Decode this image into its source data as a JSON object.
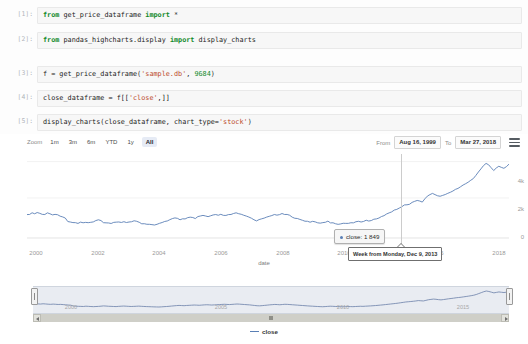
{
  "notebook": {
    "cells": [
      {
        "prompt": "[1]:",
        "segments": [
          {
            "t": "from ",
            "c": "kw"
          },
          {
            "t": "get_price_dataframe ",
            "c": "op"
          },
          {
            "t": "import ",
            "c": "kw"
          },
          {
            "t": "*",
            "c": "op"
          }
        ],
        "plain": "from get_price_dataframe import *"
      },
      {
        "prompt": "[2]:",
        "segments": [
          {
            "t": "from ",
            "c": "kw"
          },
          {
            "t": "pandas_highcharts.display ",
            "c": "op"
          },
          {
            "t": "import ",
            "c": "kw"
          },
          {
            "t": "display_charts",
            "c": "op"
          }
        ],
        "plain": "from pandas_highcharts.display import display_charts"
      },
      {
        "prompt": "[3]:",
        "segments": [
          {
            "t": "f = get_price_dataframe(",
            "c": "op"
          },
          {
            "t": "'sample.db'",
            "c": "str"
          },
          {
            "t": ", ",
            "c": "op"
          },
          {
            "t": "9684",
            "c": "num"
          },
          {
            "t": ")",
            "c": "op"
          }
        ],
        "plain": "f = get_price_dataframe('sample.db', 9684)"
      },
      {
        "prompt": "[4]:",
        "segments": [
          {
            "t": "close_dataframe = f[[",
            "c": "op"
          },
          {
            "t": "'close'",
            "c": "str"
          },
          {
            "t": ",]]",
            "c": "op"
          }
        ],
        "plain": "close_dataframe = f[['close',]]"
      },
      {
        "prompt": "[5]:",
        "segments": [
          {
            "t": "display_charts(close_dataframe, chart_type=",
            "c": "op"
          },
          {
            "t": "'stock'",
            "c": "str"
          },
          {
            "t": ")",
            "c": "op"
          }
        ],
        "plain": "display_charts(close_dataframe, chart_type='stock')"
      }
    ]
  },
  "chart_toolbar": {
    "zoom_label": "Zoom",
    "range_buttons": [
      {
        "label": "1m",
        "selected": false
      },
      {
        "label": "3m",
        "selected": false
      },
      {
        "label": "6m",
        "selected": false
      },
      {
        "label": "YTD",
        "selected": false
      },
      {
        "label": "1y",
        "selected": false
      },
      {
        "label": "All",
        "selected": true
      }
    ],
    "from_label": "From",
    "from_value": "Aug 16, 1999",
    "to_label": "To",
    "to_value": "Mar 27, 2018",
    "menu_icon": "hamburger-menu-icon"
  },
  "tooltip": {
    "series_name": "close",
    "value": "1 849",
    "text": "close: 1 849",
    "x_label": "Week from Monday, Dec 9, 2013"
  },
  "legend": {
    "items": [
      {
        "name": "close",
        "color": "#5a7fb5"
      }
    ]
  },
  "colors": {
    "series": "#5a7fb5",
    "navigator_fill": "#e9ecf2",
    "selected_button_bg": "#e6ebf5",
    "axis_text": "#9a9a9a",
    "code_bg": "#f7f7f7"
  },
  "chart_data": {
    "type": "line",
    "title": "",
    "subtitle": "",
    "xlabel": "date",
    "ylabel": "",
    "series": [
      {
        "name": "close",
        "color": "#5a7fb5",
        "values": [
          1290,
          1340,
          1390,
          1360,
          1420,
          1380,
          1330,
          1300,
          1350,
          1310,
          1270,
          1290,
          1240,
          1200,
          1150,
          1120,
          950,
          900,
          880,
          860,
          840,
          900,
          870,
          830,
          800,
          830,
          860,
          910,
          960,
          930,
          890,
          870,
          840,
          820,
          870,
          900,
          930,
          900,
          870,
          840,
          860,
          890,
          920,
          880,
          850,
          820,
          800,
          780,
          760,
          740,
          730,
          760,
          800,
          830,
          880,
          930,
          980,
          1030,
          1070,
          1040,
          1010,
          1060,
          1090,
          1120,
          1150,
          1130,
          1100,
          1140,
          1180,
          1210,
          1180,
          1150,
          1180,
          1220,
          1250,
          1280,
          1310,
          1280,
          1250,
          1290,
          1330,
          1370,
          1340,
          1300,
          1260,
          1220,
          1180,
          1120,
          1060,
          1000,
          980,
          1020,
          1080,
          1130,
          1190,
          1230,
          1280,
          1250,
          1210,
          1260,
          1310,
          1290,
          1250,
          1210,
          1170,
          1130,
          1090,
          1050,
          1010,
          970,
          930,
          900,
          870,
          840,
          810,
          790,
          820,
          860,
          900,
          880,
          850,
          820,
          800,
          780,
          810,
          840,
          820,
          800,
          830,
          860,
          890,
          870,
          900,
          930,
          960,
          1000,
          1040,
          1090,
          1140,
          1190,
          1250,
          1310,
          1370,
          1430,
          1490,
          1560,
          1640,
          1720,
          1800,
          1849,
          1900,
          1960,
          2020,
          2100,
          2060,
          2020,
          2150,
          2280,
          2350,
          2420,
          2380,
          2300,
          2250,
          2320,
          2400,
          2480,
          2550,
          2620,
          2700,
          2760,
          2820,
          2900,
          2980,
          3060,
          3150,
          3250,
          3400,
          3600,
          3800,
          4000,
          4150,
          4050,
          3900,
          3750,
          3850,
          3950,
          3880,
          3820,
          3900,
          4020
        ]
      }
    ],
    "x_ticks": [
      "2000",
      "2002",
      "2004",
      "2006",
      "2008",
      "2010",
      "2012",
      "2016",
      "2018"
    ],
    "y_ticks": [
      "0",
      "2k",
      "4k"
    ],
    "ylim": [
      0,
      4400
    ],
    "xlim": [
      "1999-08-16",
      "2018-03-27"
    ],
    "grid": true,
    "legend_position": "bottom",
    "highlight_point": {
      "x_label": "Week from Monday, Dec 9, 2013",
      "y": 1849
    },
    "navigator": {
      "x_ticks": [
        "2000",
        "2005",
        "2010",
        "2015"
      ],
      "range_start": "1999-08-16",
      "range_end": "2018-03-27"
    }
  }
}
